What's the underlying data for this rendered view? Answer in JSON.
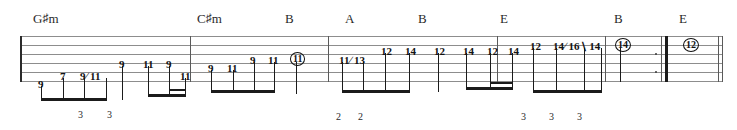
{
  "document": {
    "type": "guitar-tablature",
    "staff_lines": 6,
    "width": 737,
    "height": 130
  },
  "chords": [
    {
      "text": "G♯m",
      "root": "G",
      "accidental": "♯",
      "quality": "m",
      "x": 33
    },
    {
      "text": "C♯m",
      "root": "C",
      "accidental": "♯",
      "quality": "m",
      "x": 197
    },
    {
      "text": "B",
      "root": "B",
      "accidental": "",
      "quality": "",
      "x": 285
    },
    {
      "text": "A",
      "root": "A",
      "accidental": "",
      "quality": "",
      "x": 345
    },
    {
      "text": "B",
      "root": "B",
      "accidental": "",
      "quality": "",
      "x": 418
    },
    {
      "text": "E",
      "root": "E",
      "accidental": "",
      "quality": "",
      "x": 500
    },
    {
      "text": "B",
      "root": "B",
      "accidental": "",
      "quality": "",
      "x": 614
    },
    {
      "text": "E",
      "root": "E",
      "accidental": "",
      "quality": "",
      "x": 679
    }
  ],
  "frets": [
    {
      "text": "9",
      "x": 38,
      "y": 79,
      "circled": false
    },
    {
      "text": "7",
      "x": 60,
      "y": 71,
      "circled": false
    },
    {
      "text": "9∕ 11",
      "x": 80,
      "y": 71,
      "circled": false
    },
    {
      "text": "9",
      "x": 119,
      "y": 59,
      "circled": false
    },
    {
      "text": "11",
      "x": 143,
      "y": 59,
      "circled": false
    },
    {
      "text": "9",
      "x": 166,
      "y": 59,
      "circled": false
    },
    {
      "text": "11",
      "x": 180,
      "y": 71,
      "circled": false
    },
    {
      "text": "9",
      "x": 208,
      "y": 63,
      "circled": false
    },
    {
      "text": "11",
      "x": 227,
      "y": 63,
      "circled": false
    },
    {
      "text": "9",
      "x": 250,
      "y": 55,
      "circled": false
    },
    {
      "text": "11",
      "x": 268,
      "y": 55,
      "circled": false
    },
    {
      "text": "11",
      "x": 290,
      "y": 52,
      "circled": true
    },
    {
      "text": "11∕ 13",
      "x": 339,
      "y": 55,
      "circled": false
    },
    {
      "text": "12",
      "x": 381,
      "y": 46,
      "circled": false
    },
    {
      "text": "14",
      "x": 405,
      "y": 46,
      "circled": false
    },
    {
      "text": "12",
      "x": 434,
      "y": 46,
      "circled": false
    },
    {
      "text": "14",
      "x": 463,
      "y": 46,
      "circled": false
    },
    {
      "text": "12",
      "x": 487,
      "y": 46,
      "circled": false
    },
    {
      "text": "14",
      "x": 508,
      "y": 46,
      "circled": false
    },
    {
      "text": "12",
      "x": 530,
      "y": 41,
      "circled": false
    },
    {
      "text": "14∕ 16∖ 14",
      "x": 553,
      "y": 41,
      "circled": false
    },
    {
      "text": "14",
      "x": 615,
      "y": 38,
      "circled": true
    },
    {
      "text": "12",
      "x": 683,
      "y": 38,
      "circled": true
    }
  ],
  "tuplets": [
    {
      "text": "3",
      "x": 78,
      "y": 110
    },
    {
      "text": "3",
      "x": 107,
      "y": 110
    },
    {
      "text": "2",
      "x": 336,
      "y": 112
    },
    {
      "text": "2",
      "x": 358,
      "y": 112
    },
    {
      "text": "3",
      "x": 521,
      "y": 112
    },
    {
      "text": "3",
      "x": 549,
      "y": 112
    },
    {
      "text": "3",
      "x": 577,
      "y": 112
    }
  ],
  "measures": [
    {
      "index": 1,
      "start_x": 20,
      "end_x": 190
    },
    {
      "index": 2,
      "start_x": 190,
      "end_x": 328
    },
    {
      "index": 3,
      "start_x": 328,
      "end_x": 497
    },
    {
      "index": 4,
      "start_x": 497,
      "end_x": 605
    },
    {
      "index": 5,
      "start_x": 605,
      "end_x": 722
    }
  ],
  "colors": {
    "staff": "#8d8d8d",
    "ink": "#121212",
    "barline": "#5a5a5a",
    "paper": "#ffffff"
  }
}
